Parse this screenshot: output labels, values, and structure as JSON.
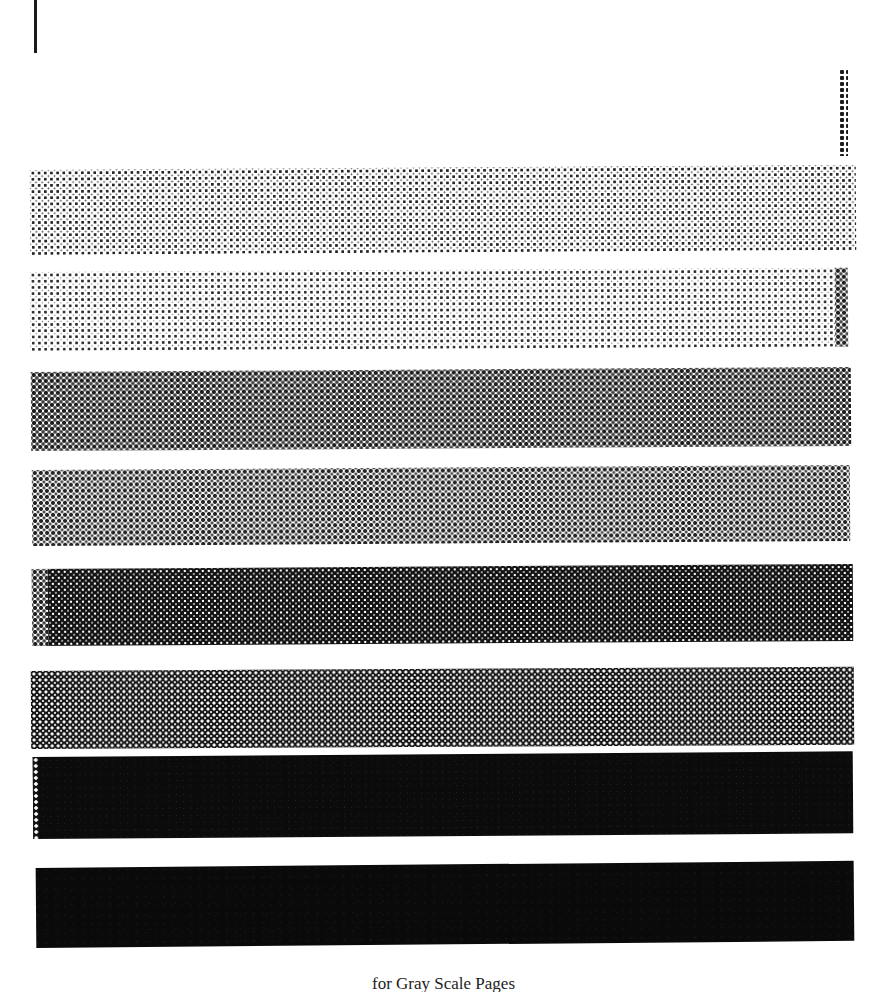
{
  "page": {
    "width": 887,
    "height": 992,
    "background": "#ffffff",
    "kind": "scanned-book-page"
  },
  "marks": {
    "edge_rule_name": "page-edge-rule",
    "corner_strip_name": "corner-dot-strip"
  },
  "caption": {
    "text": "for Gray Scale Pages",
    "note": "clipped at page bottom"
  },
  "chart_data": {
    "type": "bar",
    "xlabel": "",
    "ylabel": "Halftone density (% coverage)",
    "categories": [
      "Band 1",
      "Band 2",
      "Band 3",
      "Band 4",
      "Band 5",
      "Band 6",
      "Band 7",
      "Band 8"
    ],
    "values": [
      22,
      18,
      52,
      48,
      78,
      72,
      95,
      100
    ],
    "ylim": [
      0,
      100
    ],
    "grid": false,
    "legend": "none"
  },
  "bands": [
    {
      "index": 1,
      "label": "Band 1",
      "coverage_pct": 22,
      "tone": "light halftone dots",
      "ink": "#262626",
      "paper": "#ffffff",
      "x": 30,
      "y": 170,
      "width": 826,
      "height": 85,
      "skew_deg": -0.35,
      "pattern_class": "ht-5"
    },
    {
      "index": 2,
      "label": "Band 2",
      "coverage_pct": 18,
      "tone": "lightest halftone dots",
      "ink": "#2b2b2b",
      "paper": "#ffffff",
      "x": 30,
      "y": 272,
      "width": 818,
      "height": 79,
      "skew_deg": -0.3,
      "pattern_class": "ht-4",
      "edge": {
        "side": "right",
        "width": 13,
        "style": "edge-check",
        "name": "band-right-edge-strip"
      }
    },
    {
      "index": 3,
      "label": "Band 3",
      "coverage_pct": 52,
      "tone": "mid gray checker",
      "ink": "#1e1e1e",
      "paper": "#ffffff",
      "x": 31,
      "y": 372,
      "width": 820,
      "height": 79,
      "skew_deg": -0.35,
      "pattern_class": "ht-50a"
    },
    {
      "index": 4,
      "label": "Band 4",
      "coverage_pct": 48,
      "tone": "mid gray checker (lighter)",
      "ink": "#242424",
      "paper": "#ffffff",
      "x": 32,
      "y": 470,
      "width": 818,
      "height": 76,
      "skew_deg": -0.35,
      "pattern_class": "ht-50b"
    },
    {
      "index": 5,
      "label": "Band 5",
      "coverage_pct": 78,
      "tone": "dark halftone, white pinholes",
      "ink": "#121212",
      "paper": "#ffffff",
      "x": 32,
      "y": 569,
      "width": 821,
      "height": 77,
      "skew_deg": -0.35,
      "pattern_class": "ht-78",
      "edge": {
        "side": "left",
        "width": 16,
        "style": "edge-check",
        "name": "band-left-edge-strip"
      }
    },
    {
      "index": 6,
      "label": "Band 6",
      "coverage_pct": 72,
      "tone": "dark grid, white pinholes",
      "ink": "#141414",
      "paper": "#ffffff",
      "x": 31,
      "y": 671,
      "width": 823,
      "height": 78,
      "skew_deg": -0.3,
      "pattern_class": "ht-72"
    },
    {
      "index": 7,
      "label": "Band 7",
      "coverage_pct": 95,
      "tone": "near solid black",
      "ink": "#0b0b0b",
      "paper": "#ffffff",
      "x": 33,
      "y": 757,
      "width": 820,
      "height": 82,
      "skew_deg": -0.4,
      "pattern_class": "ht-95",
      "edge": {
        "side": "left",
        "width": 6,
        "style": "edge-light-dots",
        "name": "band-left-edge-strip"
      }
    },
    {
      "index": 8,
      "label": "Band 8",
      "coverage_pct": 100,
      "tone": "solid black",
      "ink": "#0a0a0a",
      "paper": "#ffffff",
      "x": 36,
      "y": 868,
      "width": 818,
      "height": 80,
      "skew_deg": -0.5,
      "pattern_class": "ht-100"
    }
  ]
}
